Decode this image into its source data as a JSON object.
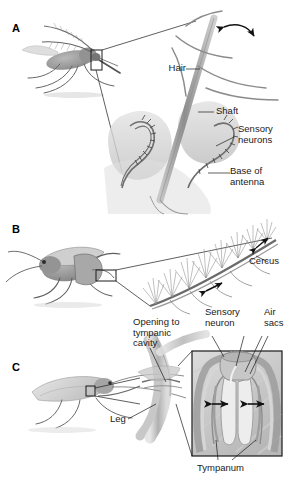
{
  "figure": {
    "background_color": "#ffffff",
    "ink_color": "#1a1a1a",
    "panel_count": 3
  },
  "panels": [
    {
      "letter": "A",
      "subject": "mosquito-antenna",
      "labels": [
        {
          "name": "hair",
          "text": "Hair"
        },
        {
          "name": "shaft",
          "text": "Shaft"
        },
        {
          "name": "sensory-neurons",
          "text": "Sensory\nneurons"
        },
        {
          "name": "base-of-antenna",
          "text": "Base of\nantenna"
        }
      ],
      "annotations": [
        {
          "name": "vibration-arrow",
          "type": "curved-double-arrow"
        }
      ]
    },
    {
      "letter": "B",
      "subject": "cricket-cercus",
      "labels": [
        {
          "name": "cercus",
          "text": "Cercus"
        }
      ],
      "annotations": [
        {
          "name": "air-current-arrow-1",
          "type": "double-arrow"
        },
        {
          "name": "air-current-arrow-2",
          "type": "double-arrow"
        }
      ]
    },
    {
      "letter": "C",
      "subject": "katydid-tympanic-organ",
      "labels": [
        {
          "name": "opening-to-tympanic-cavity",
          "text": "Opening to\ntympanic\ncavity"
        },
        {
          "name": "sensory-neuron",
          "text": "Sensory\nneuron"
        },
        {
          "name": "air-sacs",
          "text": "Air\nsacs"
        },
        {
          "name": "leg",
          "text": "Leg"
        },
        {
          "name": "tympanum",
          "text": "Tympanum"
        }
      ],
      "annotations": [
        {
          "name": "tympanum-arrow-left",
          "type": "double-arrow"
        },
        {
          "name": "tympanum-arrow-right",
          "type": "double-arrow"
        }
      ]
    }
  ]
}
